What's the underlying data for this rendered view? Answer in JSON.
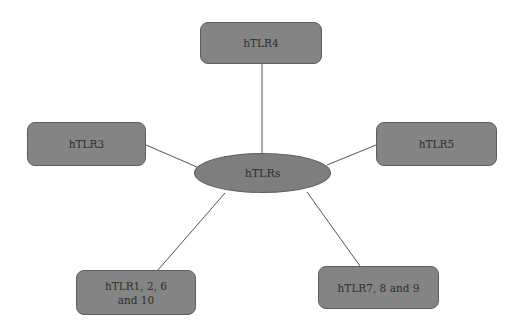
{
  "diagram": {
    "center": {
      "label": "hTLRs"
    },
    "nodes": [
      {
        "id": "tlr4",
        "label": "hTLR4"
      },
      {
        "id": "tlr3",
        "label": "hTLR3"
      },
      {
        "id": "tlr5",
        "label": "hTLR5"
      },
      {
        "id": "tlr1",
        "label": "hTLR1, 2, 6\nand 10"
      },
      {
        "id": "tlr7",
        "label": "hTLR7, 8 and 9"
      }
    ],
    "colors": {
      "node_fill": "#848484",
      "node_border": "#5e5e5e",
      "edge": "#555555",
      "text": "#2e2e2e"
    }
  }
}
